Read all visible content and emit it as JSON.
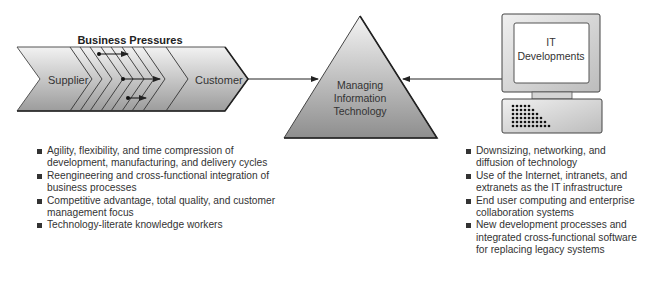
{
  "diagram": {
    "value_chain": {
      "title": "Business Pressures",
      "start_label": "Supplier",
      "end_label": "Customer"
    },
    "center": {
      "line1": "Managing",
      "line2": "Information",
      "line3": "Technology"
    },
    "computer": {
      "line1": "IT",
      "line2": "Developments"
    },
    "colors": {
      "shape_fill_dark": "#9a9a9a",
      "shape_fill_light": "#f0f0f0",
      "stroke": "#2a2a2a",
      "text": "#333333"
    }
  },
  "business_pressures": [
    "Agility, flexibility, and time compression of development, manufacturing, and delivery cycles",
    "Reengineering and cross-functional integration of business processes",
    "Competitive advantage, total quality, and customer management focus",
    "Technology-literate knowledge workers"
  ],
  "it_developments": [
    "Downsizing, networking, and diffusion of technology",
    "Use of the Internet, intranets, and extranets as the IT infrastructure",
    "End user computing and enterprise collaboration systems",
    "New development processes and integrated cross-functional software for replacing legacy systems"
  ]
}
